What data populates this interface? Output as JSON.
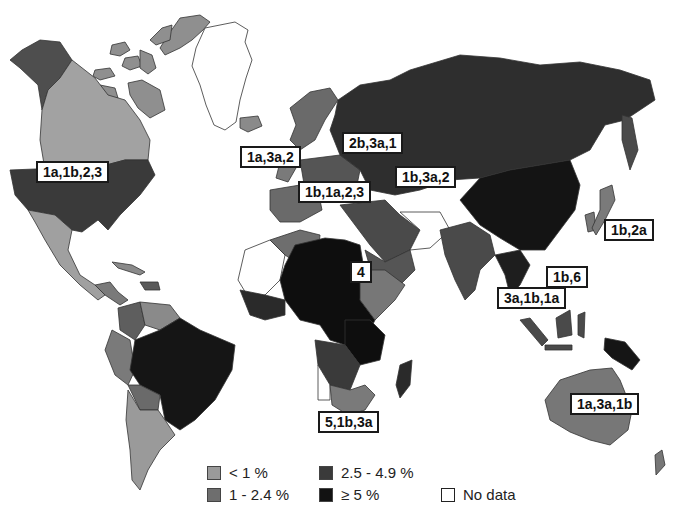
{
  "colors": {
    "lt1": "#9a9a9a",
    "c1to24": "#6e6e6e",
    "c25to49": "#3a3a3a",
    "ge5": "#121212",
    "nodata": "#ffffff",
    "border": "#333333"
  },
  "labels": {
    "north_america": "1a,1b,2,3",
    "western_europe_uk": "1a,3a,2",
    "scandinavia_baltic": "2b,3a,1",
    "central_europe": "1b,1a,2,3",
    "russia_central_asia": "1b,3a,2",
    "japan": "1b,2a",
    "east_asia": "1b,6",
    "southeast_asia": "3a,1b,1a",
    "north_central_africa": "4",
    "southern_africa": "5,1b,3a",
    "australia": "1a,3a,1b"
  },
  "legend": {
    "items": [
      {
        "label": "< 1 %",
        "color": "#9a9a9a"
      },
      {
        "label": "1 - 2.4 %",
        "color": "#6e6e6e"
      },
      {
        "label": "2.5 - 4.9 %",
        "color": "#3a3a3a"
      },
      {
        "label": "≥ 5 %",
        "color": "#121212"
      },
      {
        "label": "No data",
        "color": "#ffffff"
      }
    ]
  }
}
